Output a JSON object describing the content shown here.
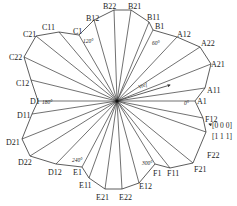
{
  "diagram": {
    "type": "space-vector-sector-diagram",
    "center": [
      117,
      101
    ],
    "line_color": "#333333",
    "vertices": [
      {
        "label": "B22",
        "x": 114,
        "y": 10,
        "lx": 103,
        "ly": 9
      },
      {
        "label": "B21",
        "x": 131,
        "y": 10,
        "lx": 128,
        "ly": 9
      },
      {
        "label": "B11",
        "x": 149,
        "y": 22,
        "lx": 147,
        "ly": 20
      },
      {
        "label": "B1",
        "x": 153,
        "y": 30,
        "lx": 155,
        "ly": 29
      },
      {
        "label": "A12",
        "x": 177,
        "y": 37,
        "lx": 177,
        "ly": 37
      },
      {
        "label": "A22",
        "x": 200,
        "y": 47,
        "lx": 201,
        "ly": 46
      },
      {
        "label": "A21",
        "x": 211,
        "y": 64,
        "lx": 211,
        "ly": 67
      },
      {
        "label": "A11",
        "x": 205,
        "y": 88,
        "lx": 207,
        "ly": 93
      },
      {
        "label": "A1",
        "x": 195,
        "y": 101,
        "lx": 197,
        "ly": 104
      },
      {
        "label": "F12",
        "x": 203,
        "y": 118,
        "lx": 205,
        "ly": 122
      },
      {
        "label": "F22",
        "x": 206,
        "y": 132,
        "lx": 207,
        "ly": 158
      },
      {
        "label": "F21",
        "x": 193,
        "y": 163,
        "lx": 194,
        "ly": 172
      },
      {
        "label": "F11",
        "x": 170,
        "y": 168,
        "lx": 167,
        "ly": 176
      },
      {
        "label": "F1",
        "x": 155,
        "y": 164,
        "lx": 153,
        "ly": 176
      },
      {
        "label": "E12",
        "x": 139,
        "y": 183,
        "lx": 139,
        "ly": 189
      },
      {
        "label": "E22",
        "x": 122,
        "y": 189,
        "lx": 119,
        "ly": 200
      },
      {
        "label": "E21",
        "x": 105,
        "y": 189,
        "lx": 96,
        "ly": 200
      },
      {
        "label": "E11",
        "x": 89,
        "y": 178,
        "lx": 79,
        "ly": 188
      },
      {
        "label": "E1",
        "x": 82,
        "y": 167,
        "lx": 73,
        "ly": 175
      },
      {
        "label": "D12",
        "x": 56,
        "y": 164,
        "lx": 48,
        "ly": 175
      },
      {
        "label": "D22",
        "x": 30,
        "y": 156,
        "lx": 18,
        "ly": 165
      },
      {
        "label": "D21",
        "x": 22,
        "y": 139,
        "lx": 6,
        "ly": 145
      },
      {
        "label": "D11",
        "x": 32,
        "y": 114,
        "lx": 17,
        "ly": 118
      },
      {
        "label": "D1",
        "x": 38,
        "y": 101,
        "lx": 30,
        "ly": 104
      },
      {
        "label": "C12",
        "x": 31,
        "y": 80,
        "lx": 16,
        "ly": 86
      },
      {
        "label": "C22",
        "x": 24,
        "y": 57,
        "lx": 9,
        "ly": 60
      },
      {
        "label": "C21",
        "x": 36,
        "y": 36,
        "lx": 23,
        "ly": 37
      },
      {
        "label": "C11",
        "x": 59,
        "y": 32,
        "lx": 42,
        "ly": 30
      },
      {
        "label": "C1",
        "x": 79,
        "y": 35,
        "lx": 73,
        "ly": 34
      },
      {
        "label": "B12",
        "x": 94,
        "y": 20,
        "lx": 86,
        "ly": 21
      }
    ],
    "angle_labels": [
      {
        "text": "0°",
        "x": 184,
        "y": 105
      },
      {
        "text": "60°",
        "x": 152,
        "y": 45
      },
      {
        "text": "120°",
        "x": 83,
        "y": 43
      },
      {
        "text": "180°",
        "x": 42,
        "y": 104
      },
      {
        "text": "240°",
        "x": 72,
        "y": 162
      },
      {
        "text": "300°",
        "x": 142,
        "y": 165
      }
    ],
    "reference_vector": {
      "label": "Vref",
      "to": [
        170,
        85
      ],
      "label_x": 139,
      "label_y": 89
    },
    "zero_vector": {
      "line1": "[0 0 0]",
      "line2": "[1 1 1]",
      "arrow_tip": [
        209,
        124
      ],
      "x": 212,
      "y1": 128,
      "y2": 139
    }
  }
}
